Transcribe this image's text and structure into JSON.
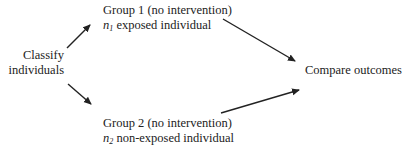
{
  "diagram": {
    "source_node": {
      "line1": "Classify",
      "line2": "individuals"
    },
    "group1": {
      "title": "Group 1 (no intervention)",
      "var": "n",
      "var_sub": "1",
      "desc": " exposed individual"
    },
    "group2": {
      "title": "Group 2 (no intervention)",
      "var": "n",
      "var_sub": "2",
      "desc": " non-exposed individual"
    },
    "target_node": {
      "label": "Compare outcomes"
    },
    "edges": [
      {
        "from": "Classify individuals",
        "to": "Group 1"
      },
      {
        "from": "Classify individuals",
        "to": "Group 2"
      },
      {
        "from": "Group 1",
        "to": "Compare outcomes"
      },
      {
        "from": "Group 2",
        "to": "Compare outcomes"
      }
    ],
    "colors": {
      "text": "#222222",
      "arrow": "#222222",
      "background": "#ffffff"
    }
  }
}
